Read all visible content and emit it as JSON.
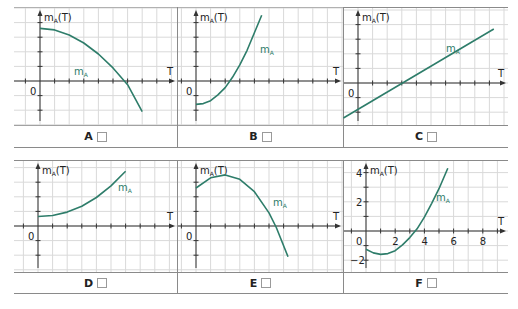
{
  "colors": {
    "curve": "#2e7d6a",
    "grid": "#d9d9d9",
    "axis": "#333333",
    "border": "#8a8a8a"
  },
  "axis_labels": {
    "y_main": "m",
    "y_sub": "A",
    "y_tail": "(T)",
    "x": "T",
    "origin": "0",
    "curve_main": "m",
    "curve_sub": "A"
  },
  "panels": [
    {
      "id": "A",
      "label": "A",
      "checkbox": false,
      "shape": "decreasing concave-down parabola, starts at max on y-axis, crosses T-axis"
    },
    {
      "id": "B",
      "label": "B",
      "checkbox": false,
      "shape": "increasing concave-up, starts negative, crosses T-axis"
    },
    {
      "id": "C",
      "label": "C",
      "checkbox": false,
      "shape": "straight line with positive slope, negative intercept"
    },
    {
      "id": "D",
      "label": "D",
      "checkbox": false,
      "shape": "increasing concave-up, positive intercept"
    },
    {
      "id": "E",
      "label": "E",
      "checkbox": false,
      "shape": "concave-down parabola with max right of y-axis, crosses T-axis"
    },
    {
      "id": "F",
      "label": "F",
      "checkbox": false,
      "shape": "concave-up parabola, min near T=1, crosses T-axis near 3.4",
      "x_ticks": [
        "2",
        "4",
        "6",
        "8"
      ],
      "y_ticks": [
        "4",
        "2",
        "-2"
      ]
    }
  ],
  "chart_data": [
    {
      "type": "line",
      "title": "A",
      "xlabel": "T",
      "ylabel": "mA(T)",
      "series": [
        {
          "name": "mA",
          "x": [
            0,
            1,
            2,
            3,
            4,
            5,
            6,
            7
          ],
          "y": [
            3.6,
            3.5,
            3.15,
            2.6,
            1.85,
            0.9,
            -0.25,
            -2.1
          ]
        }
      ]
    },
    {
      "type": "line",
      "title": "B",
      "xlabel": "T",
      "ylabel": "mA(T)",
      "series": [
        {
          "name": "mA",
          "x": [
            0,
            0.5,
            1,
            1.5,
            2,
            2.5,
            3,
            3.5,
            4,
            4.5
          ],
          "y": [
            -1.6,
            -1.55,
            -1.35,
            -0.95,
            -0.45,
            0.25,
            1.1,
            2.1,
            3.3,
            4.5
          ]
        }
      ]
    },
    {
      "type": "line",
      "title": "C",
      "xlabel": "T",
      "ylabel": "mA(T)",
      "series": [
        {
          "name": "mA",
          "x": [
            -1,
            9.3
          ],
          "y": [
            -2.4,
            3.7
          ]
        }
      ]
    },
    {
      "type": "line",
      "title": "D",
      "xlabel": "T",
      "ylabel": "mA(T)",
      "series": [
        {
          "name": "mA",
          "x": [
            0,
            1,
            2,
            3,
            4,
            5,
            6
          ],
          "y": [
            0.65,
            0.72,
            0.95,
            1.35,
            1.95,
            2.75,
            3.75
          ]
        }
      ]
    },
    {
      "type": "line",
      "title": "E",
      "xlabel": "T",
      "ylabel": "mA(T)",
      "series": [
        {
          "name": "mA",
          "x": [
            0,
            1,
            2,
            3,
            4,
            5,
            5.5,
            6.3
          ],
          "y": [
            2.6,
            3.3,
            3.5,
            3.2,
            2.35,
            0.9,
            -0.1,
            -2.1
          ]
        }
      ]
    },
    {
      "type": "line",
      "title": "F",
      "xlabel": "T",
      "ylabel": "mA(T)",
      "xlim": [
        0,
        9.5
      ],
      "ylim": [
        -2.5,
        4.5
      ],
      "x_ticks": [
        2,
        4,
        6,
        8
      ],
      "y_ticks": [
        -2,
        2,
        4
      ],
      "series": [
        {
          "name": "mA",
          "x": [
            0,
            0.5,
            1,
            1.5,
            2,
            2.5,
            3,
            3.5,
            4,
            4.5,
            5,
            5.6
          ],
          "y": [
            -1.25,
            -1.5,
            -1.6,
            -1.55,
            -1.35,
            -0.95,
            -0.45,
            0.15,
            0.95,
            1.9,
            2.9,
            4.3
          ]
        }
      ]
    }
  ]
}
